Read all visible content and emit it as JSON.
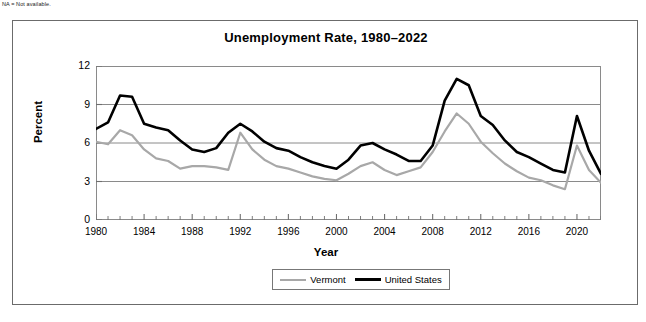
{
  "footnote": "NA = Not available.",
  "chart_data": {
    "type": "line",
    "title": "Unemployment Rate, 1980–2022",
    "xlabel": "Year",
    "ylabel": "Percent",
    "ylim": [
      0,
      12
    ],
    "yticks": [
      0,
      3,
      6,
      9,
      12
    ],
    "xlim": [
      1980,
      2022
    ],
    "xticks": [
      1980,
      1984,
      1988,
      1992,
      1996,
      2000,
      2004,
      2008,
      2012,
      2016,
      2020
    ],
    "grid": "horizontal",
    "legend_position": "bottom",
    "x": [
      1980,
      1981,
      1982,
      1983,
      1984,
      1985,
      1986,
      1987,
      1988,
      1989,
      1990,
      1991,
      1992,
      1993,
      1994,
      1995,
      1996,
      1997,
      1998,
      1999,
      2000,
      2001,
      2002,
      2003,
      2004,
      2005,
      2006,
      2007,
      2008,
      2009,
      2010,
      2011,
      2012,
      2013,
      2014,
      2015,
      2016,
      2017,
      2018,
      2019,
      2020,
      2021,
      2022
    ],
    "series": [
      {
        "name": "Vermont",
        "color": "#a8a8a8",
        "values": [
          6.1,
          5.9,
          7.0,
          6.6,
          5.5,
          4.8,
          4.6,
          4.0,
          4.2,
          4.2,
          4.1,
          3.9,
          6.8,
          5.5,
          4.7,
          4.2,
          4.0,
          3.7,
          3.4,
          3.2,
          3.1,
          3.6,
          4.2,
          4.5,
          3.9,
          3.5,
          3.8,
          4.1,
          5.3,
          6.9,
          8.3,
          7.5,
          6.1,
          5.2,
          4.4,
          3.8,
          3.3,
          3.1,
          2.7,
          2.4,
          5.8,
          3.9,
          2.9
        ]
      },
      {
        "name": "United States",
        "color": "#000000",
        "values": [
          7.1,
          7.6,
          9.7,
          9.6,
          7.5,
          7.2,
          7.0,
          6.2,
          5.5,
          5.3,
          5.6,
          6.8,
          7.5,
          6.9,
          6.1,
          5.6,
          5.4,
          4.9,
          4.5,
          4.2,
          4.0,
          4.7,
          5.8,
          6.0,
          5.5,
          5.1,
          4.6,
          4.6,
          5.8,
          9.3,
          11.0,
          10.5,
          8.1,
          7.4,
          6.2,
          5.3,
          4.9,
          4.4,
          3.9,
          3.7,
          8.1,
          5.4,
          3.6
        ]
      }
    ]
  },
  "legend": {
    "entries": [
      {
        "label": "Vermont"
      },
      {
        "label": "United States"
      }
    ]
  }
}
